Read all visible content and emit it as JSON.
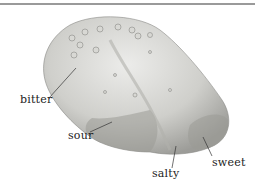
{
  "figure": {
    "labels": {
      "bitter": "bitter",
      "sour": "sour",
      "salty": "salty",
      "sweet": "sweet"
    },
    "colors": {
      "rule": "#9a9a9a",
      "tongue_light": "#e6e6e2",
      "tongue_mid": "#bdbdb8",
      "tongue_dark": "#8a8a86",
      "leader": "#333333"
    }
  }
}
